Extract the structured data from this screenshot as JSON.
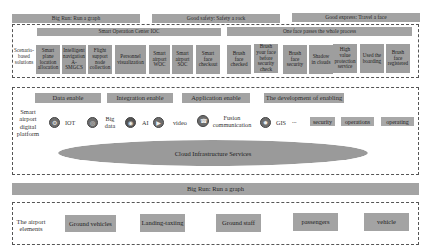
{
  "top_banners": [
    {
      "label": "Big Run: Run a graph"
    },
    {
      "label": "Good safety: Safety a rock"
    },
    {
      "label": "Good express: Travel a face"
    }
  ],
  "solutions": {
    "side_label": "Scenario-based solutions",
    "centers": [
      {
        "label": "Smart Operation Center IOC"
      },
      {
        "label": "One face passes the whole process"
      }
    ],
    "tiles": [
      {
        "label": "Smart plane location allocation"
      },
      {
        "label": "Intelligent navigation A-SMGCS"
      },
      {
        "label": "Flight support node collection"
      },
      {
        "label": "Personnel visualization"
      },
      {
        "label": "Smart airport WOC"
      },
      {
        "label": "Smart airport SOC"
      },
      {
        "label": "Smart face checkout"
      },
      {
        "label": "Brush face checked"
      },
      {
        "label": "Brush your face before security check"
      },
      {
        "label": "Brush face security"
      },
      {
        "label": "Shadow in clouds"
      },
      {
        "label": "High value protection service"
      },
      {
        "label": "Used the boarding"
      },
      {
        "label": "Brush face registered"
      }
    ]
  },
  "platform": {
    "side_label": "Smart airport digital platform",
    "enablers": [
      {
        "label": "Data enable"
      },
      {
        "label": "Integration enable"
      },
      {
        "label": "Application enable"
      },
      {
        "label": "The development of enabling"
      }
    ],
    "technologies": [
      {
        "label": "IOT",
        "icon": "iot-icon"
      },
      {
        "label": "Big data",
        "icon": "big-data-icon"
      },
      {
        "label": "AI",
        "icon": "ai-icon"
      },
      {
        "label": "video",
        "icon": "video-icon"
      },
      {
        "label": "Fusion communication",
        "icon": "communication-icon"
      },
      {
        "label": "GIS",
        "icon": "gis-icon"
      }
    ],
    "ellipsis": "...",
    "chips": [
      {
        "label": "security"
      },
      {
        "label": "operations"
      },
      {
        "label": "operating"
      }
    ],
    "cloud_label": "Cloud Infrastructure Services"
  },
  "big_run_bar": {
    "label": "Big Run: Run a graph"
  },
  "elements": {
    "side_label": "The airport elements",
    "items": [
      {
        "label": "Ground vehicles"
      },
      {
        "label": "Landing-taxiing"
      },
      {
        "label": "Ground staff"
      },
      {
        "label": "passengers"
      },
      {
        "label": "vehicle"
      }
    ]
  }
}
